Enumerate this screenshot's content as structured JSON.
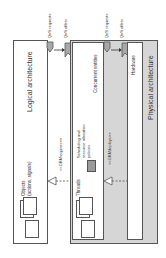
{
  "diagram": {
    "logical": {
      "title": "Logical architecture",
      "objects_label": "Objects",
      "objects_sublabel": "(actions, signals)"
    },
    "physical": {
      "title": "Physical architecture",
      "concurrent_title": "Concurrent entities",
      "threads_label": "Threads",
      "policies_line1": "Scheduling and",
      "policies_line2": "resource allocation",
      "policies_line3": "policies",
      "hardware_title": "Hardware"
    },
    "relations": {
      "requires": "<<GRMrequires>>",
      "deploys": "<<GRMdeploys>>"
    },
    "qos": {
      "requests": "QoS requests",
      "offers": "QoS offers"
    },
    "colors": {
      "physical_fill": "#d6d6d6",
      "policy_fill": "#9a9a9a",
      "qos_fill": "#a8a8a8",
      "border": "#555555"
    }
  }
}
